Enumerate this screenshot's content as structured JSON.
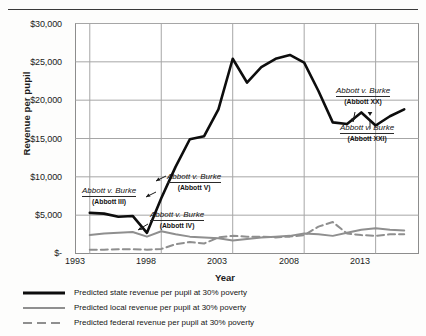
{
  "axes": {
    "ylabel": "Revenue per pupil",
    "xlabel": "Year",
    "yticks": [
      "$30,000",
      "$25,000",
      "$20,000",
      "$15,000",
      "$10,000",
      "$5,000",
      "$-"
    ],
    "xticks": [
      "1993",
      "1998",
      "2003",
      "2008",
      "2013"
    ]
  },
  "legend": {
    "items": [
      {
        "label": "Predicted state revenue per pupil at 30% poverty",
        "style": "solid-black",
        "color": "#0d0d0d"
      },
      {
        "label": "Predicted local revenue per pupil at 30% poverty",
        "style": "solid-gray",
        "color": "#8f8f8f"
      },
      {
        "label": "Predicted federal revenue per pupil at 30% poverty",
        "style": "dashed-gray",
        "color": "#8f8f8f"
      }
    ]
  },
  "annotations": [
    {
      "id": "abbott-iii",
      "title": "Abbott v. Burke",
      "subtitle": "(Abbott III)",
      "x": 82,
      "y": 186
    },
    {
      "id": "abbott-v",
      "title": "Abbott v. Burke",
      "subtitle": "(Abbott V)",
      "x": 167,
      "y": 172
    },
    {
      "id": "abbott-iv",
      "title": "Abbott v. Burke",
      "subtitle": "(Abbott IV)",
      "x": 150,
      "y": 210
    },
    {
      "id": "abbott-xx",
      "title": "Abbott v. Burke",
      "subtitle": "(Abbott XX)",
      "x": 336,
      "y": 86
    },
    {
      "id": "abbott-xxi",
      "title": "Abbott v. Burke",
      "subtitle": "(Abbott XXI)",
      "x": 340,
      "y": 123
    }
  ],
  "chart_data": {
    "type": "line",
    "title": "",
    "xlabel": "Year",
    "ylabel": "Revenue per pupil",
    "xlim": [
      1992,
      2016
    ],
    "ylim": [
      0,
      30000
    ],
    "ytick_values": [
      30000,
      25000,
      20000,
      15000,
      10000,
      5000,
      0
    ],
    "xtick_values": [
      1993,
      1998,
      2003,
      2008,
      2013
    ],
    "grid": "horizontal-and-vertical",
    "legend_position": "below-plot-left",
    "x": [
      1993,
      1994,
      1995,
      1996,
      1997,
      1998,
      1999,
      2000,
      2001,
      2002,
      2003,
      2004,
      2005,
      2006,
      2007,
      2008,
      2009,
      2010,
      2011,
      2012,
      2013,
      2014,
      2015
    ],
    "series": [
      {
        "name": "Predicted state revenue per pupil at 30% poverty",
        "style": "solid-black",
        "color": "#0d0d0d",
        "values": [
          5300,
          5200,
          4800,
          4900,
          2700,
          7200,
          11300,
          14900,
          15300,
          18800,
          25400,
          22300,
          24300,
          25400,
          25900,
          24900,
          21200,
          17100,
          16900,
          18400,
          16700,
          17900,
          18800
        ]
      },
      {
        "name": "Predicted local revenue per pupil at 30% poverty",
        "style": "solid-gray",
        "color": "#8f8f8f",
        "values": [
          2400,
          2600,
          2700,
          2800,
          2200,
          2900,
          2500,
          2200,
          2100,
          2000,
          1700,
          1900,
          2100,
          2200,
          2300,
          2600,
          2500,
          2300,
          2700,
          3100,
          3300,
          3100,
          3000
        ]
      },
      {
        "name": "Predicted federal revenue per pupil at 30% poverty",
        "style": "dashed-gray",
        "color": "#8f8f8f",
        "values": [
          500,
          500,
          550,
          550,
          500,
          600,
          1200,
          1500,
          1300,
          2100,
          2300,
          2200,
          2200,
          2100,
          2200,
          2400,
          3500,
          4100,
          2600,
          2400,
          2300,
          2500,
          2500
        ]
      }
    ]
  }
}
